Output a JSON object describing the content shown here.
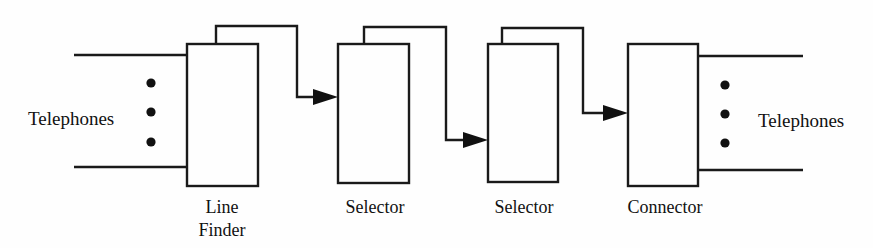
{
  "diagram": {
    "background_color": "#fefefe",
    "line_color": "#1a1a1a",
    "endpoints": {
      "left": {
        "label": "Telephones",
        "ellipsis_count": 3
      },
      "right": {
        "label": "Telephones",
        "ellipsis_count": 3
      }
    },
    "stages": [
      {
        "id": "line-finder",
        "label_line1": "Line",
        "label_line2": "Finder"
      },
      {
        "id": "selector-1",
        "label_line1": "Selector",
        "label_line2": ""
      },
      {
        "id": "selector-2",
        "label_line1": "Selector",
        "label_line2": ""
      },
      {
        "id": "connector",
        "label_line1": "Connector",
        "label_line2": ""
      }
    ]
  }
}
